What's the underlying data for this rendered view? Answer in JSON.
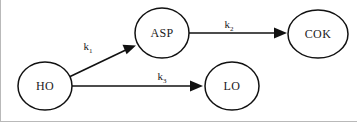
{
  "diagram": {
    "type": "reaction-scheme",
    "background_color": "#ffffff",
    "stroke_color": "#111111",
    "nodes": [
      {
        "id": "ho",
        "label": "HO",
        "cx": 45,
        "cy": 86,
        "rx": 27,
        "ry": 24
      },
      {
        "id": "asp",
        "label": "ASP",
        "cx": 162,
        "cy": 33,
        "rx": 27,
        "ry": 25
      },
      {
        "id": "cok",
        "label": "COK",
        "cx": 318,
        "cy": 34,
        "rx": 30,
        "ry": 24
      },
      {
        "id": "lo",
        "label": "LO",
        "cx": 232,
        "cy": 86,
        "rx": 27,
        "ry": 24
      }
    ],
    "edges": [
      {
        "id": "ho-asp",
        "from": "ho",
        "to": "asp",
        "rate_base": "k",
        "rate_subscript": "1",
        "label_x": 88,
        "label_y": 50,
        "x1": 67,
        "y1": 78,
        "x2": 134,
        "y2": 46
      },
      {
        "id": "asp-cok",
        "from": "asp",
        "to": "cok",
        "rate_base": "k",
        "rate_subscript": "2",
        "label_x": 229,
        "label_y": 28,
        "x1": 189,
        "y1": 33,
        "x2": 286,
        "y2": 33
      },
      {
        "id": "ho-lo",
        "from": "ho",
        "to": "lo",
        "rate_base": "k",
        "rate_subscript": "3",
        "label_x": 162,
        "label_y": 80,
        "x1": 72,
        "y1": 86,
        "x2": 203,
        "y2": 86
      }
    ]
  }
}
